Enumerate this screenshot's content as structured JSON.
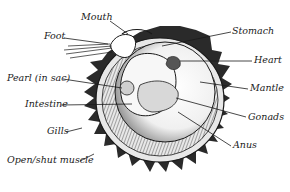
{
  "diagram": {
    "labels": [
      {
        "id": "mouth",
        "text": "Mouth"
      },
      {
        "id": "foot",
        "text": "Foot"
      },
      {
        "id": "stomach",
        "text": "Stomach"
      },
      {
        "id": "heart",
        "text": "Heart"
      },
      {
        "id": "pearl",
        "text": "Pearl (in sac)"
      },
      {
        "id": "mantle",
        "text": "Mantle"
      },
      {
        "id": "intestine",
        "text": "Intestine"
      },
      {
        "id": "gonads",
        "text": "Gonads"
      },
      {
        "id": "gills",
        "text": "Gills"
      },
      {
        "id": "anus",
        "text": "Anus"
      },
      {
        "id": "muscle",
        "text": "Open/shut muscle"
      }
    ],
    "colors": {
      "ink": "#1a1a1a",
      "shell_dark": "#2a2a2a",
      "background": "#ffffff"
    }
  }
}
